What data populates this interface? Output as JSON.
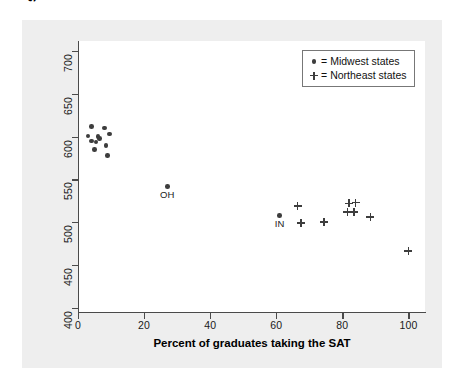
{
  "chart_data": {
    "type": "scatter",
    "title": "",
    "xlabel": "Percent of graduates taking the SAT",
    "ylabel": "State mean SAT mathematics score",
    "xlim": [
      0,
      105
    ],
    "ylim": [
      395,
      712
    ],
    "xticks": [
      0,
      20,
      40,
      60,
      80,
      100
    ],
    "yticks": [
      400,
      450,
      500,
      550,
      600,
      650,
      700
    ],
    "grid": false,
    "legend_position": "top-right",
    "legend": [
      {
        "symbol": "dot",
        "equals": "=",
        "label": "Midwest states"
      },
      {
        "symbol": "plus",
        "equals": "=",
        "label": "Northeast states"
      }
    ],
    "series": [
      {
        "name": "Midwest states",
        "marker": "dot",
        "color": "#3d3d3d",
        "points": [
          {
            "x": 4.0,
            "y": 612
          },
          {
            "x": 8.0,
            "y": 610
          },
          {
            "x": 3.0,
            "y": 601
          },
          {
            "x": 9.5,
            "y": 603
          },
          {
            "x": 6.0,
            "y": 600
          },
          {
            "x": 6.5,
            "y": 598
          },
          {
            "x": 4.0,
            "y": 595
          },
          {
            "x": 5.5,
            "y": 594
          },
          {
            "x": 8.5,
            "y": 590
          },
          {
            "x": 5.0,
            "y": 585
          },
          {
            "x": 9.0,
            "y": 578
          },
          {
            "x": 27.0,
            "y": 542,
            "label": "OH"
          },
          {
            "x": 61.0,
            "y": 508,
            "label": "IN"
          }
        ]
      },
      {
        "name": "Northeast states",
        "marker": "plus",
        "color": "#3d3d3d",
        "points": [
          {
            "x": 66.5,
            "y": 519
          },
          {
            "x": 67.5,
            "y": 499
          },
          {
            "x": 74.5,
            "y": 500
          },
          {
            "x": 82.0,
            "y": 522
          },
          {
            "x": 84.0,
            "y": 523
          },
          {
            "x": 81.5,
            "y": 512
          },
          {
            "x": 83.5,
            "y": 512
          },
          {
            "x": 88.5,
            "y": 506
          },
          {
            "x": 100.0,
            "y": 466
          }
        ]
      }
    ],
    "annotations": [
      {
        "text": "OH",
        "x": 27.0,
        "y": 542
      },
      {
        "text": "IN",
        "x": 61.0,
        "y": 508
      }
    ]
  }
}
